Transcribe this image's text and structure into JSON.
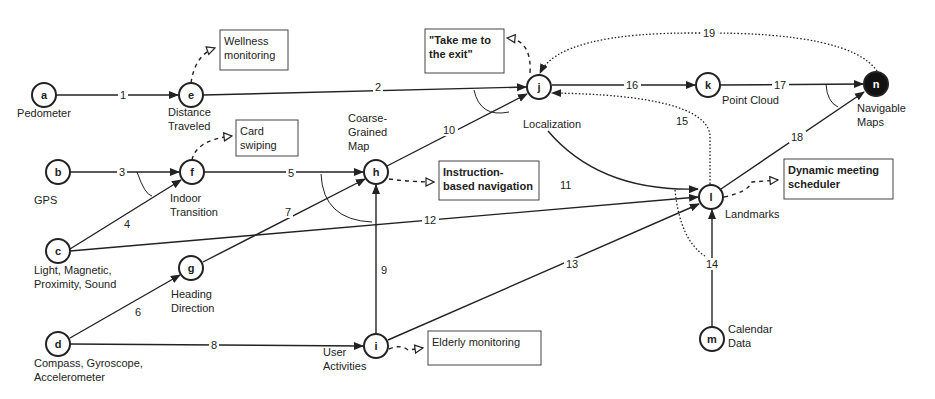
{
  "diagram": {
    "type": "sensor fusion dependency graph",
    "nodes": [
      {
        "id": "a",
        "label_lines": [
          "Pedometer"
        ],
        "x": 44,
        "y": 95,
        "lx": 44,
        "ly": 117,
        "anchor": "middle",
        "filled": false
      },
      {
        "id": "e",
        "label_lines": [
          "Distance",
          "Traveled"
        ],
        "x": 191,
        "y": 95,
        "lx": 168,
        "ly": 116,
        "anchor": "start",
        "filled": false
      },
      {
        "id": "b",
        "label_lines": [
          "GPS"
        ],
        "x": 58,
        "y": 172,
        "lx": 34,
        "ly": 204,
        "anchor": "start",
        "filled": false
      },
      {
        "id": "f",
        "label_lines": [
          "Indoor",
          "Transition"
        ],
        "x": 192,
        "y": 172,
        "lx": 170,
        "ly": 202,
        "anchor": "start",
        "filled": false
      },
      {
        "id": "c",
        "label_lines": [
          "Light, Magnetic,",
          "Proximity, Sound"
        ],
        "x": 58,
        "y": 251,
        "lx": 34,
        "ly": 274,
        "anchor": "start",
        "filled": false
      },
      {
        "id": "g",
        "label_lines": [
          "Heading",
          "Direction"
        ],
        "x": 191,
        "y": 268,
        "lx": 171,
        "ly": 298,
        "anchor": "start",
        "filled": false
      },
      {
        "id": "d",
        "label_lines": [
          "Compass, Gyroscope,",
          "Accelerometer"
        ],
        "x": 58,
        "y": 344,
        "lx": 34,
        "ly": 367,
        "anchor": "start",
        "filled": false
      },
      {
        "id": "h",
        "label_lines": [
          "Coarse-",
          "Grained",
          "Map"
        ],
        "x": 376,
        "y": 172,
        "lx": 348,
        "ly": 122,
        "anchor": "start",
        "filled": false
      },
      {
        "id": "i",
        "label_lines": [
          "User",
          "Activities"
        ],
        "x": 376,
        "y": 346,
        "lx": 323,
        "ly": 356,
        "anchor": "start",
        "filled": false
      },
      {
        "id": "j",
        "label_lines": [
          "Localization"
        ],
        "x": 539,
        "y": 87,
        "lx": 523,
        "ly": 128,
        "anchor": "start",
        "filled": false
      },
      {
        "id": "k",
        "label_lines": [
          "Point Cloud"
        ],
        "x": 708,
        "y": 85,
        "lx": 722,
        "ly": 104,
        "anchor": "start",
        "filled": false
      },
      {
        "id": "n",
        "label_lines": [
          "Navigable",
          "Maps"
        ],
        "x": 876,
        "y": 84,
        "lx": 857,
        "ly": 112,
        "anchor": "start",
        "filled": true
      },
      {
        "id": "l",
        "label_lines": [
          "Landmarks"
        ],
        "x": 711,
        "y": 197,
        "lx": 725,
        "ly": 218,
        "anchor": "start",
        "filled": false
      },
      {
        "id": "m",
        "label_lines": [
          "Calendar",
          "Data"
        ],
        "x": 712,
        "y": 339,
        "lx": 728,
        "ly": 333,
        "anchor": "start",
        "filled": false
      }
    ],
    "edges": [
      {
        "num": "1",
        "from": "a",
        "to": "e",
        "style": "solid",
        "path": "M56 95 L178 95",
        "lx": 120,
        "ly": 99
      },
      {
        "num": "2",
        "from": "e",
        "to": "j",
        "style": "solid",
        "path": "M203 95 L526 87",
        "lx": 375,
        "ly": 91
      },
      {
        "num": "3",
        "from": "b",
        "to": "f",
        "style": "solid",
        "path": "M70 172 L179 172",
        "lx": 119,
        "ly": 176
      },
      {
        "num": "4",
        "from": "c",
        "to": "f",
        "style": "solid",
        "path": "M70 249 L181 180",
        "lx": 124,
        "ly": 228
      },
      {
        "num": "5",
        "from": "f",
        "to": "h",
        "style": "solid",
        "path": "M204 172 L363 172",
        "lx": 288,
        "ly": 177
      },
      {
        "num": "6",
        "from": "d",
        "to": "g",
        "style": "solid",
        "path": "M70 338 L180 275",
        "lx": 135,
        "ly": 316
      },
      {
        "num": "7",
        "from": "g",
        "to": "h",
        "style": "solid",
        "path": "M203 262 L365 179",
        "lx": 285,
        "ly": 216
      },
      {
        "num": "8",
        "from": "d",
        "to": "i",
        "style": "solid",
        "path": "M70 344 L363 346",
        "lx": 211,
        "ly": 349
      },
      {
        "num": "9",
        "from": "i",
        "to": "h",
        "style": "solid",
        "path": "M376 334 L376 185",
        "lx": 381,
        "ly": 274
      },
      {
        "num": "10",
        "from": "h",
        "to": "j",
        "style": "solid",
        "path": "M387 166 L527 94",
        "lx": 443,
        "ly": 134
      },
      {
        "num": "11",
        "from": "j",
        "to": "l",
        "style": "solid",
        "path": "M548 131 Q600 192 698 189",
        "lx": 560,
        "ly": 189
      },
      {
        "num": "12",
        "from": "c",
        "to": "l",
        "style": "solid",
        "path": "M70 251 L698 197",
        "lx": 424,
        "ly": 224
      },
      {
        "num": "13",
        "from": "i",
        "to": "l",
        "style": "solid",
        "path": "M388 340 L699 204",
        "lx": 566,
        "ly": 268
      },
      {
        "num": "14",
        "from": "m",
        "to": "l",
        "style": "solid",
        "path": "M712 327 L712 210",
        "lx": 706,
        "ly": 268
      },
      {
        "num": "15",
        "from": "l",
        "to": "j",
        "style": "dotted",
        "path": "M710 184 L710 135 Q705 95 552 93",
        "lx": 676,
        "ly": 125
      },
      {
        "num": "16",
        "from": "j",
        "to": "k",
        "style": "solid",
        "path": "M552 85 L695 85",
        "lx": 626,
        "ly": 89
      },
      {
        "num": "17",
        "from": "k",
        "to": "n",
        "style": "solid",
        "path": "M720 85 L863 84",
        "lx": 774,
        "ly": 89
      },
      {
        "num": "18",
        "from": "l",
        "to": "n",
        "style": "solid",
        "path": "M721 189 L864 92",
        "lx": 791,
        "ly": 141
      },
      {
        "num": "19",
        "from": "n",
        "to": "j",
        "style": "dotted",
        "path": "M877 71 Q850 32 700 33 Q560 32 540 73",
        "lx": 703,
        "ly": 37
      },
      {
        "num": "",
        "from": "l",
        "to": "l-dotted",
        "style": "dotted",
        "path": "M675 190 Q680 240 705 256",
        "lx": 0,
        "ly": 0
      }
    ],
    "arcs": [
      {
        "near": "e-j",
        "path": "M474 90 Q480 118 509 112"
      },
      {
        "near": "f",
        "path": "M137 172 Q145 195 152 196"
      },
      {
        "near": "h",
        "path": "M321 174 Q323 220 372 222"
      },
      {
        "near": "n",
        "path": "M826 84 Q827 102 838 107"
      }
    ],
    "applications": [
      {
        "text_lines": [
          "Wellness",
          "monitoring"
        ],
        "bold": false,
        "x": 220,
        "y": 30,
        "w": 68,
        "h": 40,
        "from": "e",
        "arrow": "M191 83 Q195 55 215 48"
      },
      {
        "text_lines": [
          "Card",
          "swiping"
        ],
        "bold": false,
        "x": 236,
        "y": 120,
        "w": 62,
        "h": 36,
        "from": "f",
        "arrow": "M192 160 Q196 140 232 136"
      },
      {
        "text_lines": [
          "\"Take me to",
          "the exit\""
        ],
        "bold": true,
        "x": 425,
        "y": 29,
        "w": 79,
        "h": 44,
        "from": "j",
        "arrow": "M530 73 Q532 40 507 38"
      },
      {
        "text_lines": [
          "Instruction-",
          "based navigation"
        ],
        "bold": true,
        "x": 439,
        "y": 161,
        "w": 100,
        "h": 39,
        "from": "h",
        "arrow": "M389 179 Q412 182 434 182"
      },
      {
        "text_lines": [
          "Dynamic meeting",
          "scheduler"
        ],
        "bold": true,
        "x": 784,
        "y": 159,
        "w": 109,
        "h": 40,
        "from": "l",
        "arrow": "M724 197 Q748 192 752 182 L778 180"
      },
      {
        "text_lines": [
          "Elderly monitoring"
        ],
        "bold": false,
        "x": 428,
        "y": 331,
        "w": 113,
        "h": 34,
        "from": "i",
        "arrow": "M389 349 Q400 344 408 350 L423 348"
      }
    ],
    "colors": {
      "stroke": "#222222",
      "filled_node": "#111111",
      "box_border": "#444444",
      "background": "#ffffff"
    }
  }
}
